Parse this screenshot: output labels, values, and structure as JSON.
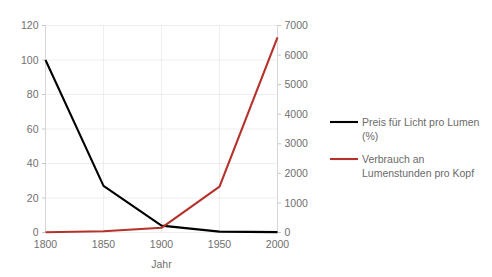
{
  "chart_data": {
    "type": "line",
    "title": "",
    "xlabel": "Jahr",
    "ylabel": "",
    "x": [
      1800,
      1850,
      1900,
      1950,
      2000
    ],
    "xtick_labels": [
      "1800",
      "1850",
      "1900",
      "1950",
      "2000"
    ],
    "xlim": [
      1800,
      2000
    ],
    "grid": true,
    "legend_position": "right",
    "axes": {
      "left": {
        "ticks": [
          0,
          20,
          40,
          60,
          80,
          100,
          120
        ],
        "tick_labels": [
          "0",
          "20",
          "40",
          "60",
          "80",
          "100",
          "120"
        ],
        "lim": [
          0,
          120
        ]
      },
      "right": {
        "ticks": [
          0,
          1000,
          2000,
          3000,
          4000,
          5000,
          6000,
          7000
        ],
        "tick_labels": [
          "0",
          "1000",
          "2000",
          "3000",
          "4000",
          "5000",
          "6000",
          "7000"
        ],
        "lim": [
          0,
          7000
        ]
      }
    },
    "series": [
      {
        "name": "Preis für Licht pro Lumen (%)",
        "legend_line1": "Preis für Licht pro Lumen",
        "legend_line2": "(%)",
        "axis": "left",
        "color": "#000000",
        "values": [
          100,
          27,
          4,
          0.5,
          0.2
        ]
      },
      {
        "name": "Verbrauch an Lumenstunden pro Kopf",
        "legend_line1": "Verbrauch an",
        "legend_line2": "Lumenstunden pro Kopf",
        "axis": "right",
        "color": "#b5322a",
        "values": [
          10,
          40,
          160,
          1550,
          6600
        ]
      }
    ]
  },
  "colors": {
    "series_black": "#000000",
    "series_red": "#b5322a",
    "gridline": "#e6e6e6",
    "axis": "#d2d2d2",
    "text": "#6f6f6f"
  }
}
